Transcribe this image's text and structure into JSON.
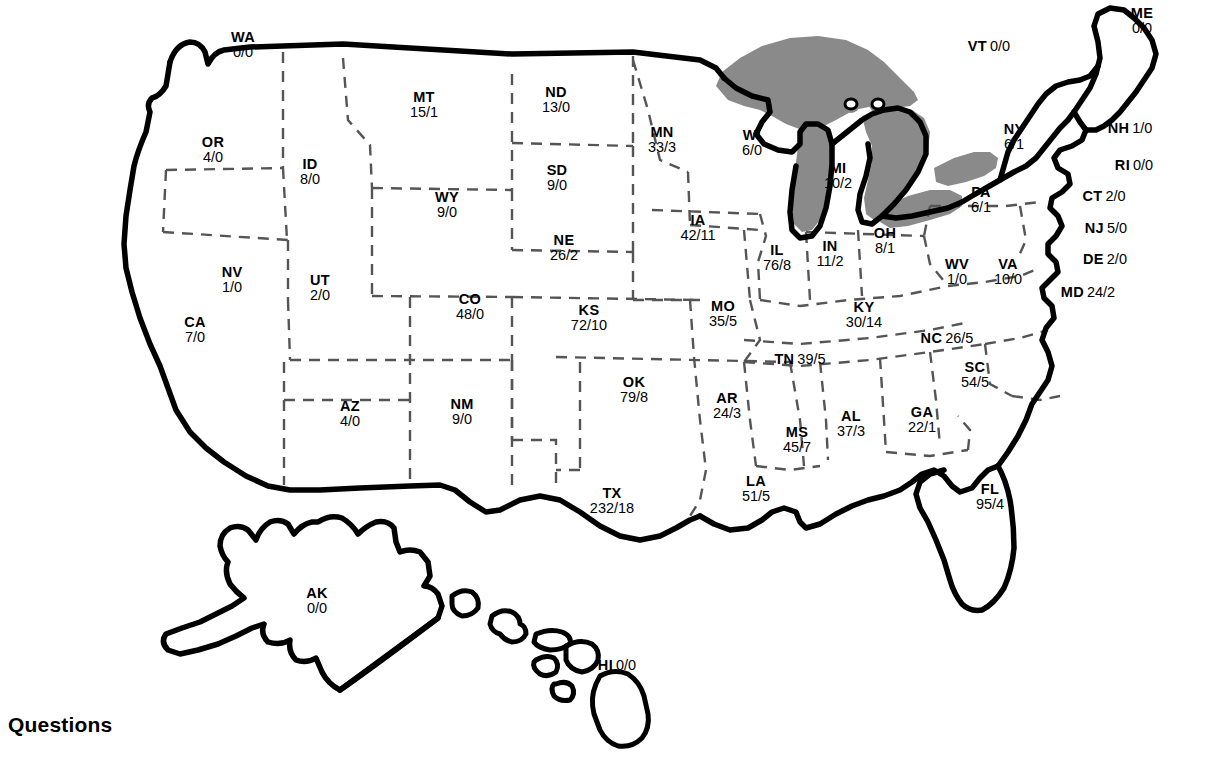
{
  "page": {
    "heading": "Questions",
    "label_format": "ABBR value1/value2",
    "colors": {
      "outline": "#000000",
      "state_border": "#555555",
      "lake_fill": "#8a8a8a",
      "background": "#ffffff",
      "text": "#000000"
    }
  },
  "map": {
    "title": "United States map with per-state two-number labels",
    "lakes_name": "great-lakes",
    "insets": [
      "AK",
      "HI"
    ]
  },
  "states": [
    {
      "abbr": "WA",
      "value": "0/0",
      "x": 243,
      "y": 45,
      "style": "stack"
    },
    {
      "abbr": "OR",
      "value": "4/0",
      "x": 213,
      "y": 150,
      "style": "stack"
    },
    {
      "abbr": "ID",
      "value": "8/0",
      "x": 310,
      "y": 172,
      "style": "stack"
    },
    {
      "abbr": "MT",
      "value": "15/1",
      "x": 424,
      "y": 105,
      "style": "stack"
    },
    {
      "abbr": "WY",
      "value": "9/0",
      "x": 447,
      "y": 205,
      "style": "stack"
    },
    {
      "abbr": "ND",
      "value": "13/0",
      "x": 556,
      "y": 100,
      "style": "stack"
    },
    {
      "abbr": "SD",
      "value": "9/0",
      "x": 557,
      "y": 178,
      "style": "stack"
    },
    {
      "abbr": "NE",
      "value": "26/2",
      "x": 564,
      "y": 248,
      "style": "stack"
    },
    {
      "abbr": "MN",
      "value": "33/3",
      "x": 662,
      "y": 140,
      "style": "stack"
    },
    {
      "abbr": "IA",
      "value": "42/11",
      "x": 698,
      "y": 228,
      "style": "stack"
    },
    {
      "abbr": "WI",
      "value": "6/0",
      "x": 752,
      "y": 143,
      "style": "stack"
    },
    {
      "abbr": "MI",
      "value": "10/2",
      "x": 838,
      "y": 176,
      "style": "stack"
    },
    {
      "abbr": "IL",
      "value": "76/8",
      "x": 777,
      "y": 258,
      "style": "stack"
    },
    {
      "abbr": "IN",
      "value": "11/2",
      "x": 830,
      "y": 254,
      "style": "stack"
    },
    {
      "abbr": "OH",
      "value": "8/1",
      "x": 885,
      "y": 241,
      "style": "stack"
    },
    {
      "abbr": "PA",
      "value": "6/1",
      "x": 981,
      "y": 200,
      "style": "stack"
    },
    {
      "abbr": "NY",
      "value": "6/1",
      "x": 1014,
      "y": 137,
      "style": "stack"
    },
    {
      "abbr": "NV",
      "value": "1/0",
      "x": 232,
      "y": 280,
      "style": "stack"
    },
    {
      "abbr": "UT",
      "value": "2/0",
      "x": 320,
      "y": 288,
      "style": "stack"
    },
    {
      "abbr": "CO",
      "value": "48/0",
      "x": 470,
      "y": 307,
      "style": "stack"
    },
    {
      "abbr": "KS",
      "value": "72/10",
      "x": 589,
      "y": 318,
      "style": "stack"
    },
    {
      "abbr": "MO",
      "value": "35/5",
      "x": 723,
      "y": 314,
      "style": "stack"
    },
    {
      "abbr": "KY",
      "value": "30/14",
      "x": 864,
      "y": 315,
      "style": "stack"
    },
    {
      "abbr": "WV",
      "value": "1/0",
      "x": 957,
      "y": 272,
      "style": "stack"
    },
    {
      "abbr": "VA",
      "value": "10/0",
      "x": 1008,
      "y": 272,
      "style": "stack"
    },
    {
      "abbr": "CA",
      "value": "7/0",
      "x": 195,
      "y": 330,
      "style": "stack"
    },
    {
      "abbr": "AZ",
      "value": "4/0",
      "x": 350,
      "y": 414,
      "style": "stack"
    },
    {
      "abbr": "NM",
      "value": "9/0",
      "x": 462,
      "y": 412,
      "style": "stack"
    },
    {
      "abbr": "OK",
      "value": "79/8",
      "x": 634,
      "y": 390,
      "style": "stack"
    },
    {
      "abbr": "AR",
      "value": "24/3",
      "x": 727,
      "y": 406,
      "style": "stack"
    },
    {
      "abbr": "MS",
      "value": "45/7",
      "x": 797,
      "y": 440,
      "style": "stack"
    },
    {
      "abbr": "AL",
      "value": "37/3",
      "x": 851,
      "y": 424,
      "style": "stack"
    },
    {
      "abbr": "GA",
      "value": "22/1",
      "x": 922,
      "y": 420,
      "style": "stack"
    },
    {
      "abbr": "LA",
      "value": "51/5",
      "x": 756,
      "y": 489,
      "style": "stack"
    },
    {
      "abbr": "TX",
      "value": "232/18",
      "x": 612,
      "y": 501,
      "style": "stack"
    },
    {
      "abbr": "FL",
      "value": "95/4",
      "x": 990,
      "y": 497,
      "style": "stack"
    },
    {
      "abbr": "AK",
      "value": "0/0",
      "x": 317,
      "y": 601,
      "style": "stack"
    },
    {
      "abbr": "TN",
      "value": "39/5",
      "x": 800,
      "y": 359,
      "style": "inline"
    },
    {
      "abbr": "NC",
      "value": "26/5",
      "x": 947,
      "y": 338,
      "style": "inline"
    },
    {
      "abbr": "SC",
      "value": "54/5",
      "x": 975,
      "y": 375,
      "style": "stack"
    },
    {
      "abbr": "VT",
      "value": "0/0",
      "x": 989,
      "y": 46,
      "style": "inline"
    },
    {
      "abbr": "ME",
      "value": "0/0",
      "x": 1142,
      "y": 21,
      "style": "stack"
    },
    {
      "abbr": "NH",
      "value": "1/0",
      "x": 1130,
      "y": 128,
      "style": "inline"
    },
    {
      "abbr": "RI",
      "value": "0/0",
      "x": 1134,
      "y": 165,
      "style": "inline"
    },
    {
      "abbr": "CT",
      "value": "2/0",
      "x": 1104,
      "y": 196,
      "style": "inline"
    },
    {
      "abbr": "NJ",
      "value": "5/0",
      "x": 1106,
      "y": 228,
      "style": "inline"
    },
    {
      "abbr": "DE",
      "value": "2/0",
      "x": 1105,
      "y": 259,
      "style": "inline"
    },
    {
      "abbr": "MD",
      "value": "24/2",
      "x": 1088,
      "y": 292,
      "style": "inline"
    },
    {
      "abbr": "HI",
      "value": "0/0",
      "x": 617,
      "y": 665,
      "style": "inline"
    }
  ]
}
